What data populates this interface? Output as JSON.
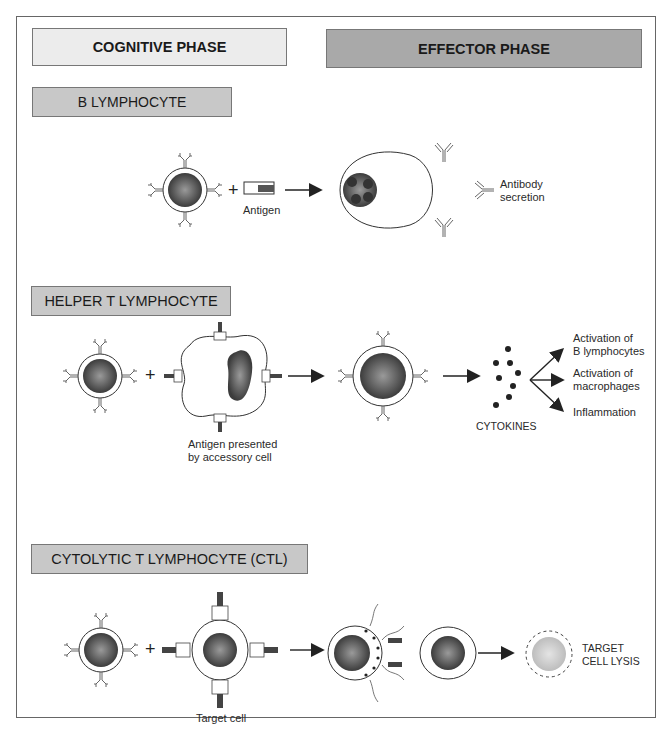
{
  "headers": {
    "cognitive_phase": "COGNITIVE PHASE",
    "effector_phase": "EFFECTOR PHASE"
  },
  "sections": [
    {
      "title": "B LYMPHOCYTE",
      "labels": {
        "antigen": "Antigen",
        "antibody_line1": "Antibody",
        "antibody_line2": "secretion"
      }
    },
    {
      "title": "HELPER T LYMPHOCYTE",
      "labels": {
        "presented_line1": "Antigen presented",
        "presented_line2": "by accessory cell",
        "cytokines": "CYTOKINES",
        "out1_line1": "Activation of",
        "out1_line2": "B lymphocytes",
        "out2_line1": "Activation of",
        "out2_line2": "macrophages",
        "out3": "Inflammation"
      }
    },
    {
      "title": "CYTOLYTIC T LYMPHOCYTE (CTL)",
      "labels": {
        "target_cell": "Target cell",
        "lysis_line1": "TARGET",
        "lysis_line2": "CELL LYSIS"
      }
    }
  ],
  "colors": {
    "cognitive_fill": "#ececec",
    "effector_fill": "#a9a9a9",
    "section_fill": "#c8c8c8",
    "nucleus_dark": "#4a4a4a",
    "lysed_nucleus": "#cfcfcf"
  }
}
